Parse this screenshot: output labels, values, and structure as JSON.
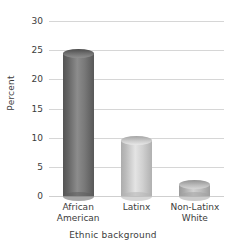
{
  "chart_data": {
    "type": "bar",
    "title": "",
    "subtitle": "",
    "categories": [
      "African\nAmerican",
      "Latinx",
      "Non-Latinx\nWhite"
    ],
    "values": [
      24.5,
      9.5,
      1.9
    ],
    "xlabel": "Ethnic background",
    "ylabel": "Percent",
    "ylim": [
      0,
      30
    ],
    "ytick_values": [
      30,
      25,
      20,
      15,
      10,
      5,
      0
    ],
    "ytick_labels": [
      "30",
      "25",
      "20",
      "15",
      "10",
      "5",
      "0"
    ],
    "grid": true,
    "legend": "none",
    "bar_colors": [
      "#6e6e6e",
      "#c6c6c6",
      "#b4b4b4"
    ],
    "gridline_color": "#d6d6d6",
    "text_color": "#3c3c3c",
    "background_color": "#ffffff"
  }
}
